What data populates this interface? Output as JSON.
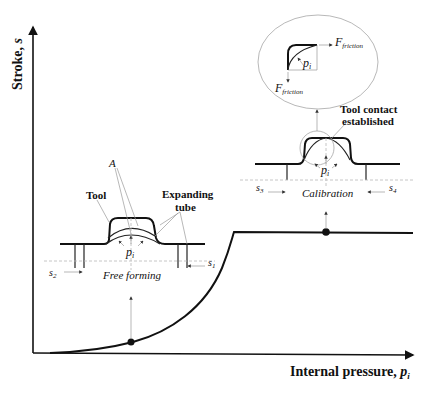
{
  "axes": {
    "y_label": "Stroke, ",
    "y_symbol": "s",
    "x_label": "Internal pressure, ",
    "x_symbol": "p",
    "x_symbol_sub": "i"
  },
  "free_forming": {
    "title": "Free forming",
    "tool_label": "Tool",
    "tube_label_line1": "Expanding",
    "tube_label_line2": "tube",
    "point_label": "A",
    "pressure_symbol": "p",
    "pressure_sub": "i",
    "left_stroke_symbol": "s",
    "left_stroke_sub": "2",
    "right_stroke_symbol": "s",
    "right_stroke_sub": "1"
  },
  "calibration": {
    "title": "Calibration",
    "contact_label_line1": "Tool contact",
    "contact_label_line2": "established",
    "pressure_symbol": "p",
    "pressure_sub": "i",
    "left_stroke_symbol": "s",
    "left_stroke_sub": "3",
    "right_stroke_symbol": "s",
    "right_stroke_sub": "4"
  },
  "detail": {
    "force_symbol": "F",
    "force_sub": "friction",
    "pressure_symbol": "p",
    "pressure_sub": "i"
  },
  "curve": {
    "stages": [
      "free forming",
      "calibration"
    ],
    "description": "stroke rises slowly then steeply with pressure, then plateaus once tool contact is established"
  }
}
